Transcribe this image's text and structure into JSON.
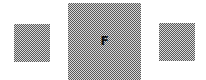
{
  "tiles": [
    {
      "position": "left",
      "label": ""
    },
    {
      "position": "center",
      "label": "F",
      "selected": true
    },
    {
      "position": "right",
      "label": ""
    }
  ],
  "colors": {
    "background": "#ffffff",
    "tile_dither_dark": "#5a5a5a",
    "tile_dither_light": "#d8d8d8",
    "letter": "#111111"
  }
}
